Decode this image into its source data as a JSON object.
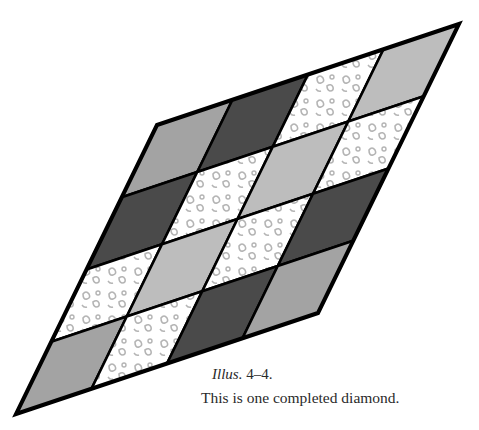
{
  "figure": {
    "type": "quilt-diamond-illustration",
    "grid_rows": 4,
    "grid_cols": 4,
    "corners": {
      "top_left": [
        157,
        125
      ],
      "top_right": [
        459,
        24
      ],
      "bottom_right": [
        318,
        313
      ],
      "bottom_left": [
        16,
        414
      ]
    },
    "fill_colors": {
      "dark": "#4a4a4a",
      "medium": "#a3a3a3",
      "light": "#bdbdbd",
      "floral": "#ffffff",
      "floral_motif": "#b0b0b0",
      "outline": "#000000"
    },
    "cells": [
      [
        "medium",
        "dark",
        "floral",
        "light"
      ],
      [
        "dark",
        "floral",
        "light",
        "floral"
      ],
      [
        "floral",
        "light",
        "floral",
        "dark"
      ],
      [
        "medium",
        "floral",
        "dark",
        "medium"
      ]
    ]
  },
  "caption": {
    "label_italic": "Illus.",
    "label_number": " 4–4.",
    "text": "This is one completed diamond."
  }
}
